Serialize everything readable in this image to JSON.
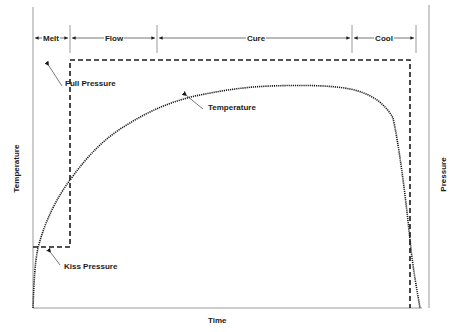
{
  "diagram": {
    "x_axis_label": "Time",
    "y_axis_left_label": "Temperature",
    "y_axis_right_label": "Pressure",
    "phases": [
      {
        "label": "Melt",
        "start_x": 33,
        "end_x": 70
      },
      {
        "label": "Flow",
        "start_x": 70,
        "end_x": 157
      },
      {
        "label": "Cure",
        "start_x": 157,
        "end_x": 352
      },
      {
        "label": "Cool",
        "start_x": 352,
        "end_x": 416
      }
    ],
    "annotations": {
      "full_pressure": "Full Pressure",
      "kiss_pressure": "Kiss Pressure",
      "temperature": "Temperature"
    },
    "series": [
      {
        "name": "Pressure",
        "style": "dashed",
        "color": "#1a1a1a",
        "description": "Kiss pressure during melt, step up to full pressure through flow and cure, released near end of cool"
      },
      {
        "name": "Temperature",
        "style": "dotted",
        "color": "#1a1a1a",
        "description": "Rapid rise, plateau through cure, steep drop during cool"
      }
    ],
    "colors": {
      "line": "#1a1a1a",
      "axis": "#999999",
      "background": "#ffffff"
    }
  }
}
